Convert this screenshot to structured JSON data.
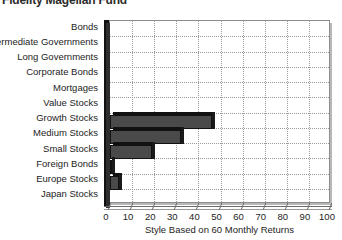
{
  "chart": {
    "title": "Fidelity Magellan Fund",
    "xlabel": "Style Based on 60 Monthly Returns"
  },
  "chart_data": {
    "type": "bar",
    "orientation": "horizontal",
    "title": "Fidelity Magellan Fund",
    "xlabel": "Style Based on 60 Monthly Returns",
    "ylabel": "",
    "xlim": [
      0,
      100
    ],
    "xticks": [
      0,
      10,
      20,
      30,
      40,
      50,
      60,
      70,
      80,
      90,
      100
    ],
    "xtick_labels": [
      "0",
      "10",
      "20",
      "30",
      "40",
      "50",
      "60",
      "70",
      "80",
      "90",
      "100"
    ],
    "grid": "dotted",
    "legend": "none",
    "bar_color": "#4a4a4a",
    "bar_edge_color": "#111111",
    "categories": [
      "Bonds",
      "Intermediate Governments",
      "Long Governments",
      "Corporate Bonds",
      "Mortgages",
      "Value Stocks",
      "Growth Stocks",
      "Medium Stocks",
      "Small Stocks",
      "Foreign Bonds",
      "Europe Stocks",
      "Japan Stocks"
    ],
    "values": [
      0,
      0,
      0,
      0,
      0,
      0,
      46,
      32,
      19,
      1,
      4,
      0
    ]
  }
}
